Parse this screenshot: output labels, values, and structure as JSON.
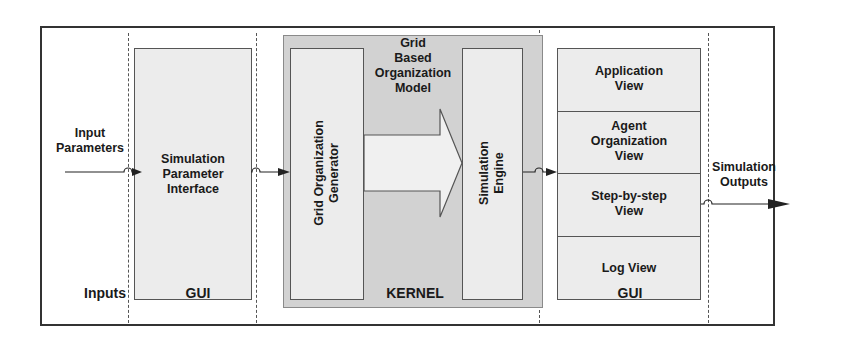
{
  "diagram": {
    "columns": [
      {
        "id": "inputs",
        "label": "Inputs"
      },
      {
        "id": "gui_left",
        "label": "GUI"
      },
      {
        "id": "kernel",
        "label": "KERNEL"
      },
      {
        "id": "gui_right",
        "label": "GUI"
      }
    ],
    "input_arrow_label_1": "Input",
    "input_arrow_label_2": "Parameters",
    "output_arrow_label_1": "Simulation",
    "output_arrow_label_2": "Outputs",
    "sim_param_interface": {
      "line1": "Simulation",
      "line2": "Parameter",
      "line3": "Interface"
    },
    "kernel_model": {
      "line1": "Grid",
      "line2": "Based",
      "line3": "Organization",
      "line4": "Model"
    },
    "grid_org_generator": {
      "line1": "Grid Organization",
      "line2": "Generator"
    },
    "simulation_engine": {
      "line1": "Simulation",
      "line2": "Engine"
    },
    "views": [
      {
        "line1": "Application",
        "line2": "View",
        "line3": ""
      },
      {
        "line1": "Agent",
        "line2": "Organization",
        "line3": "View"
      },
      {
        "line1": "Step-by-step",
        "line2": "View",
        "line3": ""
      },
      {
        "line1": "Log View",
        "line2": "",
        "line3": ""
      }
    ],
    "colors": {
      "frame": "#333333",
      "box_fill": "#ececec",
      "kernel_fill": "#d2d2d2",
      "arrow_fill": "#f0f0f0"
    }
  }
}
